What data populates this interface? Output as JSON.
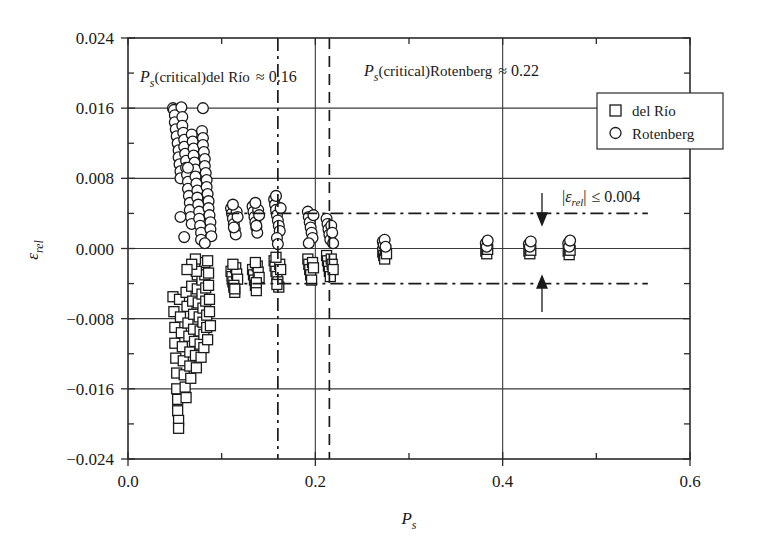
{
  "chart_data": {
    "type": "scatter",
    "title": "",
    "xlabel": "P_s",
    "ylabel": "ε_rel",
    "xlim": [
      0.0,
      0.6
    ],
    "ylim": [
      -0.024,
      0.024
    ],
    "xticks": [
      0.0,
      0.2,
      0.4,
      0.6
    ],
    "xtick_labels": [
      "0.0",
      "0.2",
      "0.4",
      "0.6"
    ],
    "yticks": [
      0.024,
      0.016,
      0.008,
      0.0,
      -0.008,
      -0.016,
      -0.024
    ],
    "ytick_labels": [
      "0.024",
      "0.016",
      "0.008",
      "0.000",
      "−0.008",
      "−0.016",
      "−0.024"
    ],
    "minor_x_ticks": [
      0.1,
      0.3,
      0.5
    ],
    "minor_y_ticks": [
      0.02,
      0.012,
      0.004,
      -0.004,
      -0.012,
      -0.02
    ],
    "grid": true,
    "legend_position": "top-right",
    "series": [
      {
        "name": "del Río",
        "marker": "square",
        "points": [
          [
            0.048,
            -0.0055
          ],
          [
            0.049,
            -0.0072
          ],
          [
            0.05,
            -0.009
          ],
          [
            0.05,
            -0.0108
          ],
          [
            0.051,
            -0.0125
          ],
          [
            0.052,
            -0.0142
          ],
          [
            0.052,
            -0.016
          ],
          [
            0.053,
            -0.0172
          ],
          [
            0.053,
            -0.0185
          ],
          [
            0.054,
            -0.0196
          ],
          [
            0.054,
            -0.0205
          ],
          [
            0.055,
            -0.0058
          ],
          [
            0.056,
            -0.0078
          ],
          [
            0.057,
            -0.0096
          ],
          [
            0.058,
            -0.0112
          ],
          [
            0.059,
            -0.0128
          ],
          [
            0.06,
            -0.0144
          ],
          [
            0.061,
            -0.0158
          ],
          [
            0.062,
            -0.017
          ],
          [
            0.062,
            -0.005
          ],
          [
            0.063,
            -0.0066
          ],
          [
            0.064,
            -0.0085
          ],
          [
            0.065,
            -0.01
          ],
          [
            0.066,
            -0.0118
          ],
          [
            0.066,
            -0.0134
          ],
          [
            0.067,
            -0.0148
          ],
          [
            0.068,
            -0.0043
          ],
          [
            0.069,
            -0.006
          ],
          [
            0.07,
            -0.0075
          ],
          [
            0.07,
            -0.0092
          ],
          [
            0.071,
            -0.0106
          ],
          [
            0.072,
            -0.0122
          ],
          [
            0.073,
            -0.0136
          ],
          [
            0.074,
            -0.003
          ],
          [
            0.074,
            -0.0046
          ],
          [
            0.075,
            -0.0062
          ],
          [
            0.076,
            -0.0078
          ],
          [
            0.077,
            -0.0094
          ],
          [
            0.077,
            -0.0109
          ],
          [
            0.078,
            -0.0124
          ],
          [
            0.078,
            -0.0021
          ],
          [
            0.079,
            -0.0036
          ],
          [
            0.079,
            -0.0052
          ],
          [
            0.08,
            -0.0068
          ],
          [
            0.08,
            -0.0084
          ],
          [
            0.081,
            -0.0098
          ],
          [
            0.081,
            -0.0113
          ],
          [
            0.082,
            -0.0016
          ],
          [
            0.082,
            -0.003
          ],
          [
            0.083,
            -0.0045
          ],
          [
            0.083,
            -0.006
          ],
          [
            0.084,
            -0.0076
          ],
          [
            0.084,
            -0.009
          ],
          [
            0.085,
            -0.0104
          ],
          [
            0.085,
            -0.0014
          ],
          [
            0.086,
            -0.0028
          ],
          [
            0.086,
            -0.0042
          ],
          [
            0.087,
            -0.0058
          ],
          [
            0.087,
            -0.0072
          ],
          [
            0.088,
            -0.0088
          ],
          [
            0.072,
            -0.0012
          ],
          [
            0.073,
            -0.0026
          ],
          [
            0.068,
            -0.0018
          ],
          [
            0.063,
            -0.0024
          ],
          [
            0.11,
            -0.0026
          ],
          [
            0.111,
            -0.0032
          ],
          [
            0.112,
            -0.0038
          ],
          [
            0.113,
            -0.0044
          ],
          [
            0.114,
            -0.005
          ],
          [
            0.115,
            -0.0022
          ],
          [
            0.116,
            -0.0029
          ],
          [
            0.117,
            -0.0035
          ],
          [
            0.112,
            -0.0018
          ],
          [
            0.113,
            -0.0042
          ],
          [
            0.114,
            -0.0046
          ],
          [
            0.133,
            -0.0024
          ],
          [
            0.134,
            -0.003
          ],
          [
            0.135,
            -0.0036
          ],
          [
            0.136,
            -0.0042
          ],
          [
            0.137,
            -0.0048
          ],
          [
            0.138,
            -0.002
          ],
          [
            0.139,
            -0.0027
          ],
          [
            0.14,
            -0.0033
          ],
          [
            0.136,
            -0.0016
          ],
          [
            0.137,
            -0.0039
          ],
          [
            0.156,
            -0.0014
          ],
          [
            0.157,
            -0.002
          ],
          [
            0.158,
            -0.0026
          ],
          [
            0.159,
            -0.0032
          ],
          [
            0.16,
            -0.0038
          ],
          [
            0.161,
            -0.0044
          ],
          [
            0.162,
            -0.0018
          ],
          [
            0.163,
            -0.0024
          ],
          [
            0.158,
            -0.001
          ],
          [
            0.159,
            -0.0041
          ],
          [
            0.192,
            -0.0012
          ],
          [
            0.193,
            -0.0018
          ],
          [
            0.194,
            -0.0024
          ],
          [
            0.195,
            -0.003
          ],
          [
            0.196,
            -0.0036
          ],
          [
            0.197,
            -0.0016
          ],
          [
            0.198,
            -0.0022
          ],
          [
            0.212,
            -0.0008
          ],
          [
            0.213,
            -0.0014
          ],
          [
            0.214,
            -0.002
          ],
          [
            0.215,
            -0.0026
          ],
          [
            0.216,
            -0.0032
          ],
          [
            0.217,
            -0.0012
          ],
          [
            0.218,
            -0.0018
          ],
          [
            0.219,
            -0.0024
          ],
          [
            0.272,
            -0.0004
          ],
          [
            0.273,
            -0.0008
          ],
          [
            0.274,
            -0.0012
          ],
          [
            0.275,
            -0.0002
          ],
          [
            0.276,
            -0.0006
          ],
          [
            0.382,
            -0.0003
          ],
          [
            0.383,
            -0.0006
          ],
          [
            0.384,
            -0.0001
          ],
          [
            0.428,
            -0.0003
          ],
          [
            0.429,
            -0.0006
          ],
          [
            0.43,
            -0.0002
          ],
          [
            0.47,
            -0.0003
          ],
          [
            0.471,
            -0.0007
          ],
          [
            0.472,
            -0.0002
          ]
        ]
      },
      {
        "name": "Rotenberg",
        "marker": "circle",
        "points": [
          [
            0.048,
            0.016
          ],
          [
            0.049,
            0.0158
          ],
          [
            0.05,
            0.0152
          ],
          [
            0.05,
            0.0144
          ],
          [
            0.051,
            0.0136
          ],
          [
            0.052,
            0.0128
          ],
          [
            0.053,
            0.012
          ],
          [
            0.054,
            0.0112
          ],
          [
            0.054,
            0.0104
          ],
          [
            0.055,
            0.0096
          ],
          [
            0.056,
            0.0088
          ],
          [
            0.056,
            0.008
          ],
          [
            0.057,
            0.0161
          ],
          [
            0.058,
            0.015
          ],
          [
            0.058,
            0.014
          ],
          [
            0.059,
            0.0132
          ],
          [
            0.06,
            0.0124
          ],
          [
            0.06,
            0.0116
          ],
          [
            0.061,
            0.0108
          ],
          [
            0.062,
            0.01
          ],
          [
            0.062,
            0.0092
          ],
          [
            0.063,
            0.0084
          ],
          [
            0.064,
            0.0076
          ],
          [
            0.064,
            0.0068
          ],
          [
            0.065,
            0.006
          ],
          [
            0.066,
            0.0052
          ],
          [
            0.066,
            0.0044
          ],
          [
            0.067,
            0.0036
          ],
          [
            0.068,
            0.0028
          ],
          [
            0.068,
            0.013
          ],
          [
            0.069,
            0.0122
          ],
          [
            0.07,
            0.0114
          ],
          [
            0.07,
            0.0106
          ],
          [
            0.071,
            0.0098
          ],
          [
            0.072,
            0.009
          ],
          [
            0.072,
            0.0082
          ],
          [
            0.073,
            0.0074
          ],
          [
            0.074,
            0.0066
          ],
          [
            0.074,
            0.0058
          ],
          [
            0.075,
            0.005
          ],
          [
            0.076,
            0.0042
          ],
          [
            0.076,
            0.0034
          ],
          [
            0.077,
            0.0026
          ],
          [
            0.078,
            0.0018
          ],
          [
            0.078,
            0.001
          ],
          [
            0.079,
            0.0134
          ],
          [
            0.08,
            0.0126
          ],
          [
            0.08,
            0.0118
          ],
          [
            0.081,
            0.011
          ],
          [
            0.082,
            0.0102
          ],
          [
            0.082,
            0.0094
          ],
          [
            0.083,
            0.0086
          ],
          [
            0.084,
            0.0078
          ],
          [
            0.084,
            0.007
          ],
          [
            0.085,
            0.0062
          ],
          [
            0.086,
            0.0054
          ],
          [
            0.086,
            0.0046
          ],
          [
            0.087,
            0.0038
          ],
          [
            0.088,
            0.003
          ],
          [
            0.088,
            0.0022
          ],
          [
            0.089,
            0.0014
          ],
          [
            0.06,
            0.0013
          ],
          [
            0.056,
            0.0036
          ],
          [
            0.064,
            0.0092
          ],
          [
            0.08,
            0.016
          ],
          [
            0.082,
            0.0006
          ],
          [
            0.11,
            0.0046
          ],
          [
            0.111,
            0.004
          ],
          [
            0.112,
            0.0034
          ],
          [
            0.113,
            0.0028
          ],
          [
            0.114,
            0.0022
          ],
          [
            0.115,
            0.0016
          ],
          [
            0.116,
            0.0042
          ],
          [
            0.117,
            0.0036
          ],
          [
            0.112,
            0.005
          ],
          [
            0.113,
            0.0024
          ],
          [
            0.133,
            0.0048
          ],
          [
            0.134,
            0.0042
          ],
          [
            0.135,
            0.0036
          ],
          [
            0.136,
            0.003
          ],
          [
            0.137,
            0.0024
          ],
          [
            0.138,
            0.0018
          ],
          [
            0.139,
            0.0044
          ],
          [
            0.14,
            0.0038
          ],
          [
            0.136,
            0.0052
          ],
          [
            0.137,
            0.0026
          ],
          [
            0.156,
            0.0056
          ],
          [
            0.157,
            0.005
          ],
          [
            0.158,
            0.0044
          ],
          [
            0.159,
            0.0038
          ],
          [
            0.16,
            0.0032
          ],
          [
            0.161,
            0.0026
          ],
          [
            0.162,
            0.002
          ],
          [
            0.163,
            0.0046
          ],
          [
            0.158,
            0.006
          ],
          [
            0.159,
            0.0012
          ],
          [
            0.16,
            0.0005
          ],
          [
            0.192,
            0.0042
          ],
          [
            0.193,
            0.0036
          ],
          [
            0.194,
            0.003
          ],
          [
            0.195,
            0.0024
          ],
          [
            0.196,
            0.0018
          ],
          [
            0.197,
            0.0012
          ],
          [
            0.198,
            0.0038
          ],
          [
            0.193,
            0.0006
          ],
          [
            0.212,
            0.0034
          ],
          [
            0.213,
            0.0028
          ],
          [
            0.214,
            0.0022
          ],
          [
            0.215,
            0.0016
          ],
          [
            0.216,
            0.001
          ],
          [
            0.217,
            0.0026
          ],
          [
            0.218,
            0.0018
          ],
          [
            0.219,
            0.0006
          ],
          [
            0.272,
            0.0008
          ],
          [
            0.273,
            0.0004
          ],
          [
            0.274,
            0.001
          ],
          [
            0.275,
            0.0002
          ],
          [
            0.382,
            0.0006
          ],
          [
            0.383,
            0.0002
          ],
          [
            0.384,
            0.0009
          ],
          [
            0.428,
            0.0005
          ],
          [
            0.429,
            0.0002
          ],
          [
            0.43,
            0.0008
          ],
          [
            0.47,
            0.0006
          ],
          [
            0.471,
            0.0002
          ],
          [
            0.472,
            0.0009
          ]
        ]
      }
    ],
    "reference_lines": [
      {
        "id": "critical-delrio",
        "orientation": "vertical",
        "value": 0.16,
        "style": "dash-dot"
      },
      {
        "id": "critical-rotenberg",
        "orientation": "vertical",
        "value": 0.215,
        "style": "dashed"
      },
      {
        "id": "tolerance-upper",
        "orientation": "horizontal",
        "value": 0.004,
        "style": "dash-dot",
        "x_start": 0.105,
        "x_end": 0.555
      },
      {
        "id": "tolerance-lower",
        "orientation": "horizontal",
        "value": -0.004,
        "style": "dash-dot",
        "x_start": 0.105,
        "x_end": 0.555
      }
    ],
    "annotations": [
      {
        "id": "annotation-critical-delrio",
        "text": "P_s(critical)del Río ≈ 0.16",
        "value": 0.16
      },
      {
        "id": "annotation-critical-rotenberg",
        "text": "P_s(critical)Rotenberg ≈ 0.22",
        "value": 0.22
      },
      {
        "id": "annotation-tolerance",
        "text": "|ε_rel| ≤ 0.004",
        "value": 0.004
      }
    ]
  },
  "axes": {
    "y_tick_labels": [
      "0.024",
      "0.016",
      "0.008",
      "0.000",
      "−0.008",
      "−0.016",
      "−0.024"
    ],
    "x_tick_labels": [
      "0.0",
      "0.2",
      "0.4",
      "0.6"
    ],
    "y_label_main": "ε",
    "y_label_sub": "rel",
    "x_label_main": "P",
    "x_label_sub": "s"
  },
  "annotation_delrio": {
    "p": "P",
    "sub": "s",
    "paren": "(critical)del Río",
    "approx": "≈ 0.16"
  },
  "annotation_rotenberg": {
    "p": "P",
    "sub": "s",
    "paren": "(critical)Rotenberg",
    "approx": "≈ 0.22"
  },
  "annotation_tolerance": {
    "bar_open": "|",
    "eps": "ε",
    "sub": "rel",
    "bar_close": "|",
    "rest": "≤ 0.004"
  },
  "legend": {
    "items": [
      {
        "label": "del Río",
        "marker": "square"
      },
      {
        "label": "Rotenberg",
        "marker": "circle"
      }
    ]
  }
}
